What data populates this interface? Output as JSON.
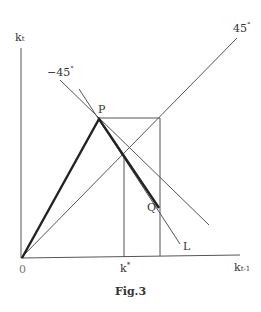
{
  "figure": {
    "caption": "Fig.3",
    "y_axis_label": "k",
    "y_axis_subscript": "t",
    "x_axis_label": "k",
    "x_axis_subscript": "t-1",
    "origin_label": "0",
    "kstar_label": "k",
    "kstar_superscript": "*",
    "line_45_label": "45",
    "line_45_degree": "°",
    "line_neg45_label": "−45",
    "line_neg45_degree": "°",
    "point_p_label": "P",
    "point_q_label": "Q",
    "line_l_label": "L"
  },
  "colors": {
    "line": "#444444",
    "thick_line": "#222222",
    "text": "#333333"
  }
}
